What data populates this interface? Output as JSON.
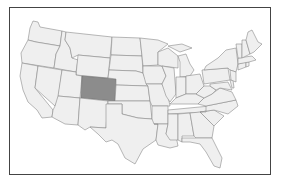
{
  "map": {
    "title": "",
    "region": "Contiguous United States",
    "highlighted_state": "Colorado",
    "colors": {
      "background": "#ffffff",
      "frame": "#444444",
      "state_fill": "#efefef",
      "state_border": "#8a8a8a",
      "highlight_fill": "#8c8c8c"
    },
    "states": [
      "Washington",
      "Oregon",
      "California",
      "Idaho",
      "Nevada",
      "Montana",
      "Wyoming",
      "Utah",
      "Arizona",
      "Colorado",
      "New Mexico",
      "North Dakota",
      "South Dakota",
      "Nebraska",
      "Kansas",
      "Oklahoma",
      "Texas",
      "Minnesota",
      "Iowa",
      "Missouri",
      "Arkansas",
      "Louisiana",
      "Wisconsin",
      "Illinois",
      "Michigan",
      "Indiana",
      "Ohio",
      "Kentucky",
      "Tennessee",
      "Mississippi",
      "Alabama",
      "Georgia",
      "Florida",
      "South Carolina",
      "North Carolina",
      "Virginia",
      "West Virginia",
      "Pennsylvania",
      "New York",
      "Maryland",
      "Delaware",
      "New Jersey",
      "Connecticut",
      "Rhode Island",
      "Massachusetts",
      "Vermont",
      "New Hampshire",
      "Maine"
    ]
  }
}
